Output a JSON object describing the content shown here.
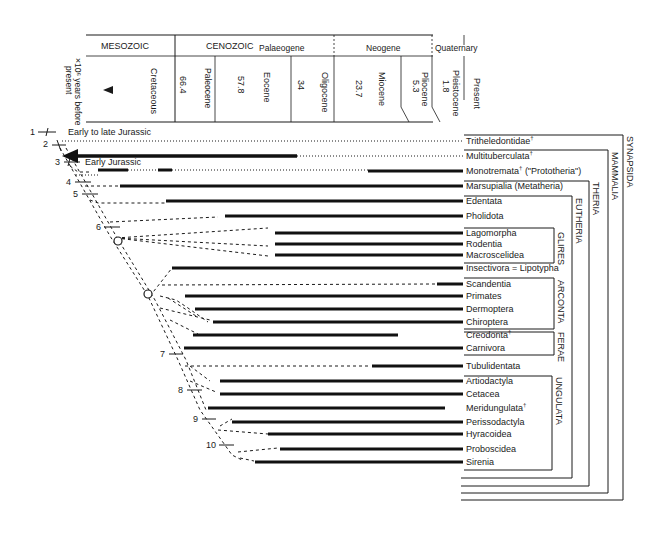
{
  "header": {
    "eras": [
      {
        "label": "MESOZOIC"
      },
      {
        "label": "CENOZOIC"
      }
    ],
    "periods": [
      {
        "label": "Palaeogene"
      },
      {
        "label": "Neogene"
      },
      {
        "label": "Quaternary"
      }
    ],
    "axis_label_line1": "×10⁶ years before",
    "axis_label_line2": "present",
    "epochs": [
      {
        "label": "Cretaceous",
        "value": ""
      },
      {
        "label": "Paleocene",
        "value": "66.4"
      },
      {
        "label": "Eocene",
        "value": "57.8"
      },
      {
        "label": "Oligocene",
        "value": "34"
      },
      {
        "label": "Miocene",
        "value": "23.7"
      },
      {
        "label": "Pliocene",
        "value": "5.3"
      },
      {
        "label": "Pleistocene",
        "value": "1.8"
      },
      {
        "label": "Present",
        "value": ""
      }
    ]
  },
  "node_notes": {
    "n1": "Early to late Jurassic",
    "n3": "Early Jurassic"
  },
  "nodes": [
    "1",
    "2",
    "3",
    "4",
    "5",
    "6",
    "7",
    "8",
    "9",
    "10"
  ],
  "taxa": [
    {
      "name": "Tritheledontidae",
      "mark": "†"
    },
    {
      "name": "Multituberculata",
      "mark": "†"
    },
    {
      "name": "Monotremata",
      "mark": "†",
      "suffix": " (\"Prototheria\")"
    },
    {
      "name": "Marsupialia (Metatheria)",
      "mark": ""
    },
    {
      "name": "Edentata",
      "mark": ""
    },
    {
      "name": "Pholidota",
      "mark": ""
    },
    {
      "name": "Lagomorpha",
      "mark": ""
    },
    {
      "name": "Rodentia",
      "mark": ""
    },
    {
      "name": "Macroscelidea",
      "mark": ""
    },
    {
      "name": "Insectivora = Lipotypha",
      "mark": ""
    },
    {
      "name": "Scandentia",
      "mark": ""
    },
    {
      "name": "Primates",
      "mark": ""
    },
    {
      "name": "Dermoptera",
      "mark": ""
    },
    {
      "name": "Chiroptera",
      "mark": ""
    },
    {
      "name": "Creodonta",
      "mark": "†"
    },
    {
      "name": "Carnivora",
      "mark": ""
    },
    {
      "name": "Tubulidentata",
      "mark": ""
    },
    {
      "name": "Artiodactyla",
      "mark": ""
    },
    {
      "name": "Cetacea",
      "mark": ""
    },
    {
      "name": "Meridungulata",
      "mark": "†"
    },
    {
      "name": "Perissodactyla",
      "mark": ""
    },
    {
      "name": "Hyracoidea",
      "mark": ""
    },
    {
      "name": "Proboscidea",
      "mark": ""
    },
    {
      "name": "Sirenia",
      "mark": ""
    }
  ],
  "groups": {
    "glires": "GLIRES",
    "arconta": "ARCONTA",
    "ferae": "FERAE",
    "ungulata": "UNGULATA",
    "eutheria": "EUTHERIA",
    "theria": "THERIA",
    "mammalia": "MAMMALIA",
    "synapsida": "SYNAPSIDA"
  }
}
